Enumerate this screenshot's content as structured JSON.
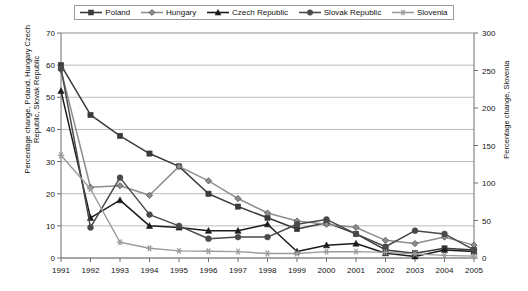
{
  "legend": {
    "position": "top",
    "items": [
      {
        "label": "Poland",
        "marker": "square",
        "color": "#3a3a3a"
      },
      {
        "label": "Hungary",
        "marker": "diamond",
        "color": "#8e8e8e"
      },
      {
        "label": "Czech Republic",
        "marker": "triangle",
        "color": "#1c1c1c"
      },
      {
        "label": "Slovak Republic",
        "marker": "circle",
        "color": "#4a4a4a"
      },
      {
        "label": "Slovenia",
        "marker": "asterisk",
        "color": "#9c9c9c"
      }
    ]
  },
  "axes": {
    "y_left": {
      "label": "Percentage change, Poland, Hungary Czech Republic, Slovak Republic",
      "min": 0,
      "max": 70,
      "step": 10,
      "ticks": [
        "0",
        "10",
        "20",
        "30",
        "40",
        "50",
        "60",
        "70"
      ]
    },
    "y_right": {
      "label": "Percentage change, Slovenia",
      "min": 0,
      "max": 300,
      "step": 50,
      "ticks": [
        "0",
        "50",
        "100",
        "150",
        "200",
        "250",
        "300"
      ]
    },
    "x": {
      "label": "",
      "ticks": [
        "1991",
        "1992",
        "1993",
        "1994",
        "1995",
        "1996",
        "1997",
        "1998",
        "1999",
        "2000",
        "2001",
        "2002",
        "2003",
        "2004",
        "2005"
      ]
    }
  },
  "chart_data": {
    "type": "line",
    "title": "",
    "xlabel": "",
    "ylabel": "Percentage change, Poland, Hungary Czech Republic, Slovak Republic",
    "ylabel_secondary": "Percentage change, Slovenia",
    "ylim": [
      0,
      70
    ],
    "ylim_secondary": [
      0,
      300
    ],
    "grid": true,
    "legend_position": "top",
    "x": [
      "1991",
      "1992",
      "1993",
      "1994",
      "1995",
      "1996",
      "1997",
      "1998",
      "1999",
      "2000",
      "2001",
      "2002",
      "2003",
      "2004",
      "2005"
    ],
    "series": [
      {
        "name": "Poland",
        "axis": "left",
        "marker": "square",
        "color": "#3a3a3a",
        "values": [
          60,
          44.5,
          38,
          32.5,
          28.5,
          20,
          16,
          12.5,
          9,
          11,
          7.5,
          2.5,
          1.5,
          3,
          2.5
        ]
      },
      {
        "name": "Hungary",
        "axis": "left",
        "marker": "diamond",
        "color": "#8e8e8e",
        "values": [
          58.5,
          22,
          22.5,
          19.5,
          28.5,
          24,
          18.5,
          14,
          11.5,
          10.5,
          9.5,
          5.5,
          4.5,
          6.5,
          4
        ]
      },
      {
        "name": "Czech Republic",
        "axis": "left",
        "marker": "triangle",
        "color": "#1c1c1c",
        "values": [
          52,
          12.5,
          18,
          10,
          9.5,
          8.5,
          8.5,
          10.5,
          2,
          4,
          4.5,
          1.5,
          0.5,
          2.5,
          2
        ]
      },
      {
        "name": "Slovak Republic",
        "axis": "left",
        "marker": "circle",
        "color": "#4a4a4a",
        "values": [
          59,
          9.5,
          25,
          13.5,
          10,
          6,
          6.5,
          6.5,
          10.5,
          12,
          7.5,
          3.5,
          8.5,
          7.5,
          2.5
        ]
      },
      {
        "name": "Slovenia",
        "axis": "right",
        "marker": "asterisk",
        "color": "#9c9c9c",
        "values": [
          137,
          92,
          21,
          13,
          9.5,
          9,
          8.5,
          6,
          6,
          8.5,
          8.5,
          7.5,
          5.5,
          3.5,
          2.5
        ]
      }
    ]
  }
}
